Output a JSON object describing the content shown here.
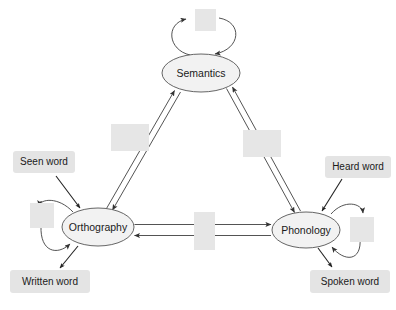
{
  "figure": {
    "background_color": "#ffffff"
  },
  "colors": {
    "node_fill": "#f2f2f2",
    "node_stroke": "#555555",
    "hidden_unit_box_fill": "#e6e6e6",
    "io_label_fill": "#e4e4e4",
    "connection_stroke": "#404040",
    "text_color": "#1a1a1a"
  },
  "nodes": [
    {
      "id": "semantics",
      "label": "Semantics",
      "cx": 201,
      "cy": 73,
      "rx": 39,
      "ry": 19
    },
    {
      "id": "orthography",
      "label": "Orthography",
      "cx": 98,
      "cy": 227,
      "rx": 36,
      "ry": 19
    },
    {
      "id": "phonology",
      "label": "Phonology",
      "cx": 306,
      "cy": 230,
      "rx": 34,
      "ry": 18
    }
  ],
  "hidden_unit_boxes": [
    {
      "id": "semantics-self-units",
      "x": 195,
      "y": 9,
      "w": 21,
      "h": 22
    },
    {
      "id": "orthography-semantics-units",
      "x": 111,
      "y": 124,
      "w": 38,
      "h": 27
    },
    {
      "id": "semantics-phonology-units",
      "x": 243,
      "y": 130,
      "w": 38,
      "h": 27
    },
    {
      "id": "orthography-self-units",
      "x": 30,
      "y": 203,
      "w": 24,
      "h": 25
    },
    {
      "id": "orthography-phonology-units",
      "x": 194,
      "y": 212,
      "w": 21,
      "h": 38
    },
    {
      "id": "phonology-self-units",
      "x": 350,
      "y": 217,
      "w": 24,
      "h": 25
    }
  ],
  "io_labels": [
    {
      "id": "seen-word",
      "text": "Seen word",
      "x": 13,
      "y": 151,
      "w": 62,
      "h": 22,
      "direction": "input"
    },
    {
      "id": "heard-word",
      "text": "Heard word",
      "x": 325,
      "y": 156,
      "w": 66,
      "h": 22,
      "direction": "input"
    },
    {
      "id": "written-word",
      "text": "Written word",
      "x": 10,
      "y": 270,
      "w": 80,
      "h": 23,
      "direction": "output"
    },
    {
      "id": "spoken-word",
      "text": "Spoken word",
      "x": 310,
      "y": 270,
      "w": 80,
      "h": 23,
      "direction": "output"
    }
  ],
  "connections": [
    {
      "id": "orthography-to-semantics",
      "from": "orthography",
      "to": "semantics",
      "bidirectional": true
    },
    {
      "id": "semantics-to-phonology",
      "from": "semantics",
      "to": "phonology",
      "bidirectional": true
    },
    {
      "id": "orthography-to-phonology",
      "from": "orthography",
      "to": "phonology",
      "bidirectional": true
    },
    {
      "id": "semantics-self",
      "from": "semantics",
      "to": "semantics",
      "bidirectional": true
    },
    {
      "id": "orthography-self",
      "from": "orthography",
      "to": "orthography",
      "bidirectional": true
    },
    {
      "id": "phonology-self",
      "from": "phonology",
      "to": "phonology",
      "bidirectional": true
    }
  ]
}
